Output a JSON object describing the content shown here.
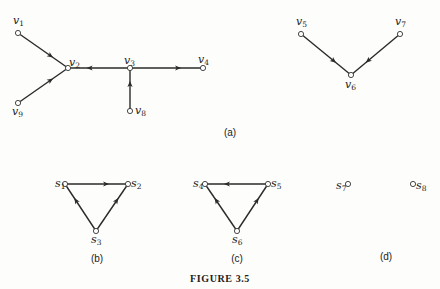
{
  "figure": {
    "caption": "FIGURE 3.5",
    "panels": {
      "a": {
        "label": "(a)",
        "nodes": [
          {
            "id": "v1",
            "letter": "v",
            "sub": "1",
            "x": 18,
            "y": 33,
            "lx": 13,
            "ly": 24
          },
          {
            "id": "v2",
            "letter": "v",
            "sub": "2",
            "x": 68,
            "y": 68,
            "lx": 69,
            "ly": 66
          },
          {
            "id": "v3",
            "letter": "v",
            "sub": "3",
            "x": 130,
            "y": 68,
            "lx": 124,
            "ly": 64
          },
          {
            "id": "v4",
            "letter": "v",
            "sub": "4",
            "x": 203,
            "y": 68,
            "lx": 198,
            "ly": 63
          },
          {
            "id": "v9",
            "letter": "v",
            "sub": "9",
            "x": 18,
            "y": 103,
            "lx": 12,
            "ly": 115
          },
          {
            "id": "v8",
            "letter": "v",
            "sub": "8",
            "x": 130,
            "y": 111,
            "lx": 135,
            "ly": 114
          },
          {
            "id": "v5",
            "letter": "v",
            "sub": "5",
            "x": 301,
            "y": 34,
            "lx": 296,
            "ly": 25
          },
          {
            "id": "v6",
            "letter": "v",
            "sub": "6",
            "x": 351,
            "y": 75,
            "lx": 345,
            "ly": 88
          },
          {
            "id": "v7",
            "letter": "v",
            "sub": "7",
            "x": 400,
            "y": 34,
            "lx": 395,
            "ly": 25
          }
        ],
        "edges": [
          {
            "from": "v1",
            "to": "v2"
          },
          {
            "from": "v9",
            "to": "v2"
          },
          {
            "from": "v3",
            "to": "v2"
          },
          {
            "from": "v3",
            "to": "v4"
          },
          {
            "from": "v8",
            "to": "v3"
          },
          {
            "from": "v5",
            "to": "v6"
          },
          {
            "from": "v7",
            "to": "v6"
          }
        ],
        "label_pos": {
          "x": 230,
          "y": 136
        }
      },
      "b": {
        "label": "(b)",
        "nodes": [
          {
            "id": "s1",
            "letter": "s",
            "sub": "1",
            "x": 65,
            "y": 184,
            "lx": 55,
            "ly": 187
          },
          {
            "id": "s2",
            "letter": "s",
            "sub": "2",
            "x": 128,
            "y": 184,
            "lx": 131,
            "ly": 187
          },
          {
            "id": "s3",
            "letter": "s",
            "sub": "3",
            "x": 96,
            "y": 231,
            "lx": 91,
            "ly": 243
          }
        ],
        "edges": [
          {
            "from": "s1",
            "to": "s2"
          },
          {
            "from": "s3",
            "to": "s1"
          },
          {
            "from": "s3",
            "to": "s2"
          }
        ],
        "label_pos": {
          "x": 97,
          "y": 262
        }
      },
      "c": {
        "label": "(c)",
        "nodes": [
          {
            "id": "s4",
            "letter": "s",
            "sub": "4",
            "x": 205,
            "y": 184,
            "lx": 193,
            "ly": 187
          },
          {
            "id": "s5",
            "letter": "s",
            "sub": "5",
            "x": 268,
            "y": 184,
            "lx": 271,
            "ly": 187
          },
          {
            "id": "s6",
            "letter": "s",
            "sub": "6",
            "x": 237,
            "y": 231,
            "lx": 232,
            "ly": 243
          }
        ],
        "edges": [
          {
            "from": "s5",
            "to": "s4"
          },
          {
            "from": "s6",
            "to": "s4"
          },
          {
            "from": "s6",
            "to": "s5"
          }
        ],
        "label_pos": {
          "x": 237,
          "y": 262
        }
      },
      "d": {
        "label": "(d)",
        "nodes": [
          {
            "id": "s7",
            "letter": "s",
            "sub": "7",
            "x": 348,
            "y": 184,
            "lx": 336,
            "ly": 189
          },
          {
            "id": "s8",
            "letter": "s",
            "sub": "8",
            "x": 413,
            "y": 184,
            "lx": 416,
            "ly": 189
          }
        ],
        "edges": [],
        "label_pos": {
          "x": 386,
          "y": 260
        }
      }
    },
    "caption_pos": {
      "x": 220,
      "y": 282
    },
    "colors": {
      "edge": "#2a2a2a",
      "node_fill": "#ffffff",
      "text": "#222222",
      "background": "#fdfdfb"
    }
  }
}
